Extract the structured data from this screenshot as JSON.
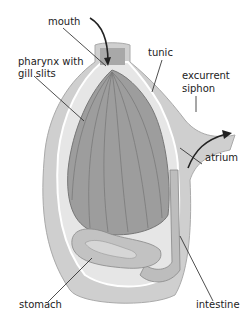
{
  "diagram": {
    "style": "grayscale illustration",
    "labels": {
      "mouth": "mouth",
      "tunic": "tunic",
      "pharynx_line1": "pharynx with",
      "pharynx_line2": "gill slits",
      "excurrent_line1": "excurrent",
      "excurrent_line2": "siphon",
      "atrium": "atrium",
      "stomach": "stomach",
      "intestine": "intestine"
    },
    "colors": {
      "tunic": "#c9c9c9",
      "inner_wall": "#e4e4e4",
      "pharynx": "#9a9a9a",
      "organs": "#b5b5b5",
      "leader": "#222222"
    }
  }
}
